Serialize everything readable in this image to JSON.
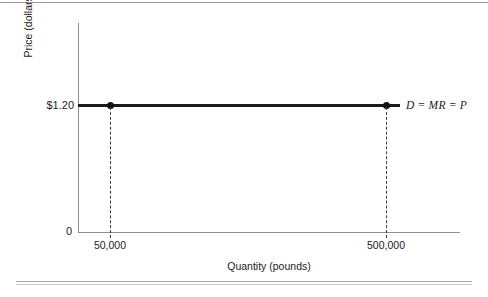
{
  "chart_data": {
    "type": "line",
    "title": "",
    "xlabel": "Quantity (pounds)",
    "ylabel": "Price (dollars per pound)",
    "origin_label": "0",
    "xticks": [
      "50,000",
      "500,000"
    ],
    "xtick_values": [
      50000,
      500000
    ],
    "yticks": [
      "$1.20"
    ],
    "ytick_values": [
      1.2
    ],
    "xlim": [
      0,
      620000
    ],
    "ylim": [
      0,
      2.1
    ],
    "grid": false,
    "legend": "none",
    "series": [
      {
        "name": "D = MR = P",
        "label": "D = MR = P",
        "style": "horizontal-line",
        "color": "#111111",
        "y_value": 1.2,
        "x_start": 0,
        "x_end": 540000,
        "points": [
          {
            "x": 50000,
            "y": 1.2,
            "marker": "filled-circle"
          },
          {
            "x": 500000,
            "y": 1.2,
            "marker": "filled-circle"
          }
        ]
      }
    ],
    "annotations": [
      {
        "name": "drop-line-50000",
        "type": "dashed-vertical",
        "x": 50000,
        "from_y": 1.2,
        "to_y": 0
      },
      {
        "name": "drop-line-500000",
        "type": "dashed-vertical",
        "x": 500000,
        "from_y": 1.2,
        "to_y": 0
      }
    ]
  },
  "figure": {
    "curve_label": "D = MR = P",
    "y_tick_label": "$1.20",
    "origin_label": "0",
    "x_tick_left": "50,000",
    "x_tick_right": "500,000",
    "x_axis_title": "Quantity (pounds)",
    "y_axis_title": "Price (dollars per pound)",
    "colors": {
      "line": "#111111",
      "axis": "#8d8d8d",
      "text": "#1c1c1c",
      "rule": "#a8a8a8",
      "background": "#ffffff"
    }
  }
}
